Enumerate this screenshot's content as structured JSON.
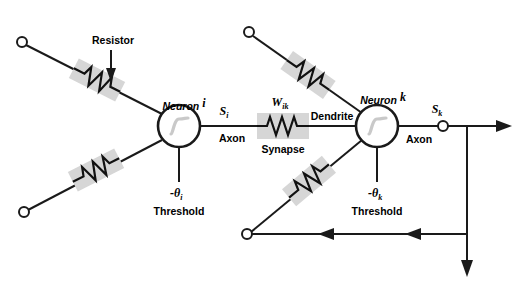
{
  "diagram": {
    "colors": {
      "line": "#1a1a1a",
      "highlight_box": "#d6d6d6",
      "sigmoid": "#c9c9c9",
      "background": "#ffffff"
    },
    "labels": {
      "resistor": "Resistor",
      "neuron_i": "Neuron i",
      "neuron_i_name": "Neuron",
      "neuron_i_index": "i",
      "neuron_k_name": "Neuron",
      "neuron_k_index": "k",
      "axon_left": "Axon",
      "axon_right": "Axon",
      "synapse": "Synapse",
      "dendrite": "Dendrite",
      "threshold_left": "Threshold",
      "threshold_right": "Threshold",
      "s_i_symbol": "S",
      "s_i_sub": "i",
      "s_k_symbol": "S",
      "s_k_sub": "k",
      "w_ik_symbol": "W",
      "w_ik_sub": "ik",
      "theta_i_symbol": "-θ",
      "theta_i_sub": "i",
      "theta_k_symbol": "-θ",
      "theta_k_sub": "k"
    },
    "icons": {
      "resistor_pointer": "arrow-down-icon",
      "output_arrow": "arrow-right-icon",
      "feedback_arrow_1": "arrow-left-icon",
      "feedback_arrow_2": "arrow-left-icon",
      "down_output_arrow": "arrow-down-icon",
      "neuron_transfer": "sigmoid-icon"
    },
    "nodes": [
      {
        "id": "in-top-left",
        "name": "input-terminal-top-left",
        "cx": 22,
        "cy": 42,
        "r": 5
      },
      {
        "id": "in-bottom-left",
        "name": "input-terminal-bottom-left",
        "cx": 24,
        "cy": 212,
        "r": 5
      },
      {
        "id": "in-top-right",
        "name": "input-terminal-top-right",
        "cx": 249,
        "cy": 32,
        "r": 5
      },
      {
        "id": "in-bottom-right",
        "name": "input-terminal-bottom-right",
        "cx": 247,
        "cy": 234,
        "r": 5
      },
      {
        "id": "out-sk",
        "name": "output-terminal-sk",
        "cx": 443,
        "cy": 127,
        "r": 5
      }
    ],
    "neurons": [
      {
        "id": "neuron-i",
        "name": "neuron-i-body",
        "cx": 179,
        "cy": 126,
        "r": 21
      },
      {
        "id": "neuron-k",
        "name": "neuron-k-body",
        "cx": 377,
        "cy": 126,
        "r": 21
      }
    ],
    "resistors": [
      {
        "id": "res-1",
        "name": "resistor-top-left",
        "cx": 97,
        "cy": 80,
        "angle": 37
      },
      {
        "id": "res-2",
        "name": "resistor-bottom-left",
        "cx": 96,
        "cy": 170,
        "angle": -37
      },
      {
        "id": "res-3",
        "name": "resistor-top-right",
        "cx": 311,
        "cy": 73,
        "angle": 40
      },
      {
        "id": "res-4",
        "name": "resistor-bottom-right",
        "cx": 311,
        "cy": 180,
        "angle": -40
      },
      {
        "id": "synapse",
        "name": "synapse-resistor",
        "cx": 283,
        "cy": 126,
        "angle": 0
      }
    ]
  }
}
